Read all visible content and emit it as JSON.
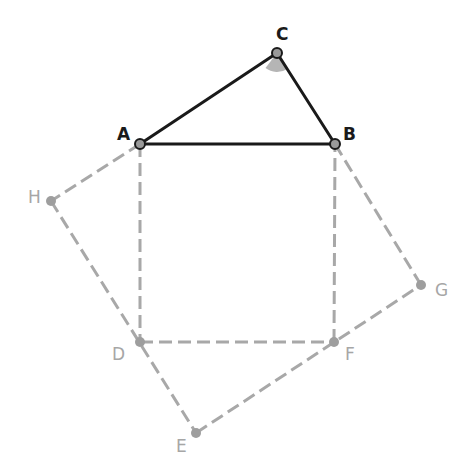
{
  "diagram": {
    "colors": {
      "main_stroke": "#1a1a1a",
      "aux_stroke": "#a8a8a8",
      "point_fill_main": "#9a9a9a",
      "point_fill_aux": "#9e9e9e",
      "angle_fill": "#b5b5b5"
    },
    "points": {
      "A": {
        "label": "A",
        "x": 140,
        "y": 144
      },
      "B": {
        "label": "B",
        "x": 335,
        "y": 144
      },
      "C": {
        "label": "C",
        "x": 277,
        "y": 53
      },
      "D": {
        "label": "D",
        "x": 140,
        "y": 342
      },
      "E": {
        "label": "E",
        "x": 196,
        "y": 433
      },
      "F": {
        "label": "F",
        "x": 334,
        "y": 342
      },
      "G": {
        "label": "G",
        "x": 421,
        "y": 285
      },
      "H": {
        "label": "H",
        "x": 51,
        "y": 201
      }
    },
    "solid_segments": [
      "AB",
      "BC",
      "CA"
    ],
    "dashed_segments": [
      "AD",
      "DF",
      "FB",
      "AH",
      "HE",
      "EG",
      "GB"
    ],
    "angle_marker": {
      "vertex": "C",
      "radius": 19
    }
  }
}
